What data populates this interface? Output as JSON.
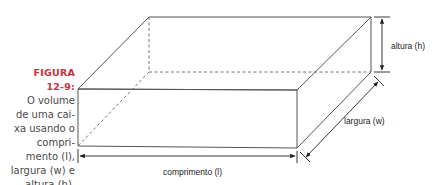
{
  "caption": {
    "label_line1": "FIGURA",
    "label_line2": "12-9:",
    "lines": [
      "O volume",
      "de uma cai-",
      "xa usando o",
      "compri-",
      "mento (l),",
      "largura (w) e",
      "altura (h)."
    ]
  },
  "labels": {
    "height": "altura (h)",
    "width": "largura (w)",
    "length": "comprimento (l)"
  },
  "colors": {
    "accent": "#c8323a",
    "line": "#555555",
    "text": "#4a4a4a"
  }
}
